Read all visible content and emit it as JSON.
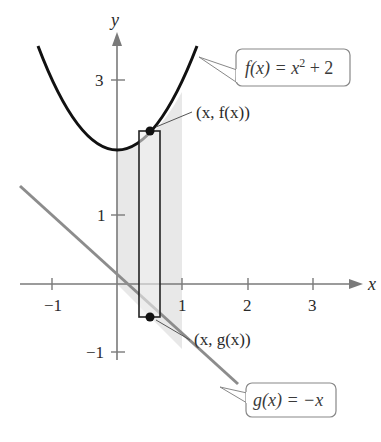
{
  "figure": {
    "axes": {
      "x_label": "x",
      "y_label": "y",
      "x_ticks": [
        {
          "value": -1,
          "label": "−1"
        },
        {
          "value": 1,
          "label": "1"
        },
        {
          "value": 2,
          "label": "2"
        },
        {
          "value": 3,
          "label": "3"
        }
      ],
      "y_ticks": [
        {
          "value": 3,
          "label": "3"
        },
        {
          "value": 1,
          "label": "1"
        },
        {
          "value": -1,
          "label": "−1"
        }
      ],
      "x_range": [
        -1.5,
        3.6
      ],
      "y_range": [
        -1.5,
        3.6
      ]
    },
    "curves": [
      {
        "name": "f",
        "expression": "f(x) = x^2 + 2",
        "label": "f(x) = x² + 2",
        "color": "#111111"
      },
      {
        "name": "g",
        "expression": "g(x) = -x",
        "label": "g(x) = −x",
        "color": "#8c8c8c"
      }
    ],
    "shaded_region": {
      "x_from": 0,
      "x_to": 1,
      "color": "#e6e6e6"
    },
    "representative_rectangle": {
      "x_left": 0.33,
      "x_right": 0.66
    },
    "points": [
      {
        "label": "(x, f(x))"
      },
      {
        "label": "(x, g(x))"
      }
    ],
    "callouts": {
      "f_label": "f(x) = x",
      "f_exponent": "2",
      "f_rest": " + 2",
      "g_label": "g(x) = −x"
    }
  }
}
